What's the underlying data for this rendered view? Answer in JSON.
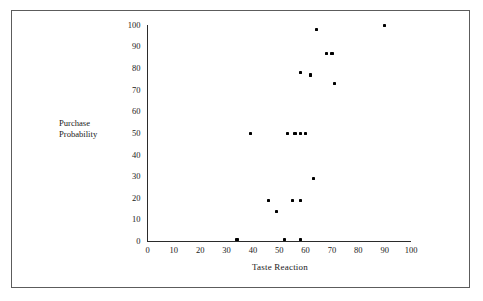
{
  "chart_data": {
    "type": "scatter",
    "title": "",
    "xlabel": "Taste Reaction",
    "ylabel": "Purchase Probability",
    "ylabel_lines": [
      "Purchase",
      "Probability"
    ],
    "xlim": [
      0,
      100
    ],
    "ylim": [
      0,
      100
    ],
    "xticks": [
      "0",
      "10",
      "20",
      "30",
      "40",
      "50",
      "60",
      "70",
      "80",
      "90",
      "100"
    ],
    "yticks": [
      "0",
      "10",
      "20",
      "30",
      "40",
      "50",
      "60",
      "70",
      "80",
      "90",
      "100"
    ],
    "xtick_values": [
      0,
      10,
      20,
      30,
      40,
      50,
      60,
      70,
      80,
      90,
      100
    ],
    "ytick_values": [
      0,
      10,
      20,
      30,
      40,
      50,
      60,
      70,
      80,
      90,
      100
    ],
    "grid": false,
    "legend": false,
    "marker": "square-dot",
    "marker_color": "#000000",
    "points": [
      {
        "x": 34,
        "y": 1
      },
      {
        "x": 52,
        "y": 1
      },
      {
        "x": 58,
        "y": 1
      },
      {
        "x": 49,
        "y": 14
      },
      {
        "x": 46,
        "y": 19
      },
      {
        "x": 55,
        "y": 19
      },
      {
        "x": 58,
        "y": 19
      },
      {
        "x": 63,
        "y": 29
      },
      {
        "x": 39,
        "y": 50
      },
      {
        "x": 53,
        "y": 50
      },
      {
        "x": 56,
        "y": 50
      },
      {
        "x": 58,
        "y": 50
      },
      {
        "x": 60,
        "y": 50
      },
      {
        "x": 71,
        "y": 73
      },
      {
        "x": 58,
        "y": 78
      },
      {
        "x": 62,
        "y": 77
      },
      {
        "x": 68,
        "y": 87
      },
      {
        "x": 70,
        "y": 87
      },
      {
        "x": 64,
        "y": 98
      },
      {
        "x": 90,
        "y": 100
      }
    ]
  },
  "figure": {
    "background_color": "#ffffff",
    "frame_color": "#5c5c5c",
    "axis_color": "#2b2b2b"
  }
}
